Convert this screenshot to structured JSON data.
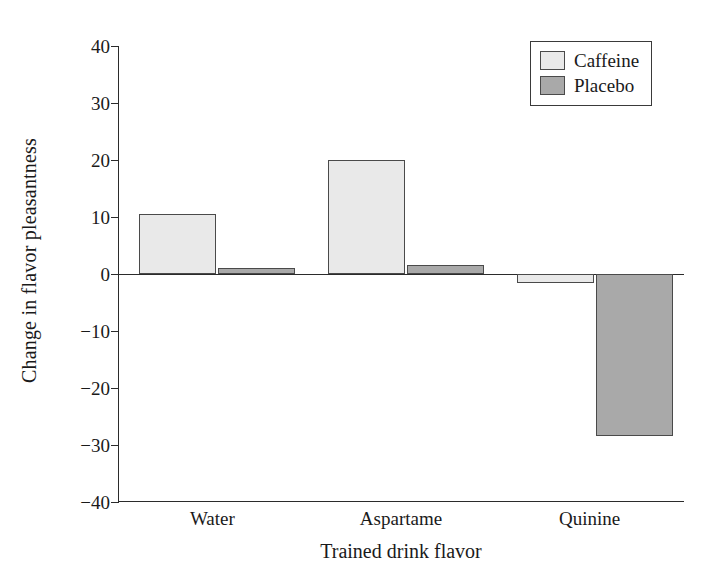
{
  "chart_data": {
    "type": "bar",
    "title": "",
    "xlabel": "Trained drink flavor",
    "ylabel": "Change in flavor pleasantness",
    "categories": [
      "Water",
      "Aspartame",
      "Quinine"
    ],
    "series": [
      {
        "name": "Caffeine",
        "color": "#e9e9e9",
        "values": [
          10.5,
          20.0,
          -1.5
        ]
      },
      {
        "name": "Placebo",
        "color": "#a9a9a9",
        "values": [
          1.0,
          1.6,
          -28.5
        ]
      }
    ],
    "ylim": [
      -40,
      40
    ],
    "yticks": [
      40,
      30,
      20,
      10,
      0,
      -10,
      -20,
      -30,
      -40
    ],
    "ytick_labels": [
      "40",
      "30",
      "20",
      "10",
      "0",
      "−10",
      "−20",
      "−30",
      "−40"
    ],
    "grid": false,
    "legend_position": "top-right",
    "zero_line": true
  },
  "legend": {
    "entries": [
      {
        "label": "Caffeine"
      },
      {
        "label": "Placebo"
      }
    ]
  }
}
